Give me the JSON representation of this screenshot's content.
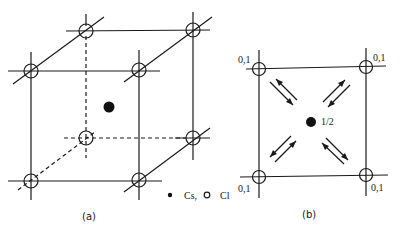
{
  "figure": {
    "panel_a": {
      "caption": "(a)",
      "description": "CsCl cubic unit cell",
      "legend": {
        "cs_symbol": "filled-dot",
        "cs_label": "Cs,",
        "cl_symbol": "open-circle",
        "cl_label": "Cl"
      }
    },
    "panel_b": {
      "caption": "(b)",
      "corner_labels": [
        "0,1",
        "0,1",
        "0,1",
        "0,1"
      ],
      "center_label": "1/2"
    }
  },
  "colors": {
    "ink": "#1a1a1a",
    "background": "#ffffff"
  }
}
